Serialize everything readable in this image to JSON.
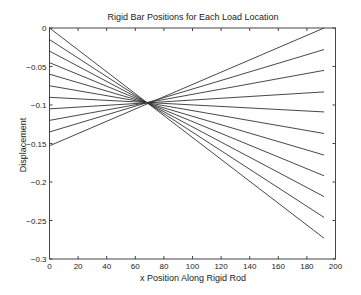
{
  "chart_data": {
    "type": "line",
    "title": "Rigid Bar Positions for Each Load Location",
    "xlabel": "x Position Along Rigid Rod",
    "ylabel": "Displacement",
    "xlim": [
      0,
      200
    ],
    "ylim": [
      -0.3,
      0
    ],
    "xticks": [
      0,
      20,
      40,
      60,
      80,
      100,
      120,
      140,
      160,
      180,
      200
    ],
    "yticks": [
      0,
      -0.05,
      -0.1,
      -0.15,
      -0.2,
      -0.25,
      -0.3
    ],
    "xtick_labels": [
      "0",
      "20",
      "40",
      "60",
      "80",
      "100",
      "120",
      "140",
      "160",
      "180",
      "200"
    ],
    "ytick_labels": [
      "0",
      "-0.05",
      "-0.1",
      "-0.15",
      "-0.2",
      "-0.25",
      "-0.3"
    ],
    "grid": false,
    "legend": null,
    "line_color": "#333333",
    "pivot": {
      "x": 70,
      "y": -0.0975
    },
    "series": [
      {
        "name": "load 1",
        "x": [
          0,
          192
        ],
        "y": [
          0.0,
          -0.273
        ]
      },
      {
        "name": "load 2",
        "x": [
          0,
          192
        ],
        "y": [
          -0.015,
          -0.246
        ]
      },
      {
        "name": "load 3",
        "x": [
          0,
          192
        ],
        "y": [
          -0.03,
          -0.219
        ]
      },
      {
        "name": "load 4",
        "x": [
          0,
          192
        ],
        "y": [
          -0.045,
          -0.192
        ]
      },
      {
        "name": "load 5",
        "x": [
          0,
          192
        ],
        "y": [
          -0.06,
          -0.165
        ]
      },
      {
        "name": "load 6",
        "x": [
          0,
          192
        ],
        "y": [
          -0.075,
          -0.137
        ]
      },
      {
        "name": "load 7",
        "x": [
          0,
          192
        ],
        "y": [
          -0.09,
          -0.109
        ]
      },
      {
        "name": "load 8",
        "x": [
          0,
          192
        ],
        "y": [
          -0.105,
          -0.083
        ]
      },
      {
        "name": "load 9",
        "x": [
          0,
          192
        ],
        "y": [
          -0.12,
          -0.055
        ]
      },
      {
        "name": "load 10",
        "x": [
          0,
          192
        ],
        "y": [
          -0.135,
          -0.028
        ]
      },
      {
        "name": "load 11",
        "x": [
          0,
          192
        ],
        "y": [
          -0.153,
          0.0
        ]
      }
    ]
  }
}
